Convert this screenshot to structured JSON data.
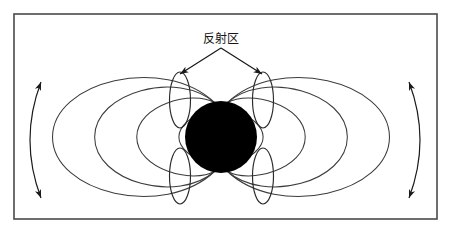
{
  "figure": {
    "title_label": "反射区",
    "frame": {
      "x": 14,
      "y": 14,
      "width": 423,
      "height": 205,
      "stroke": "#4a4a4a",
      "fill": "#ffffff"
    },
    "core": {
      "name": "central-body",
      "cx": 221,
      "cy": 137,
      "r": 36,
      "color": "#000000"
    },
    "label": {
      "text": "反射区",
      "x": 221,
      "y": 43,
      "color": "#151515",
      "font_size": 12
    },
    "pointers": [
      {
        "from_x": 221,
        "from_y": 48,
        "to_x": 180,
        "to_y": 74,
        "direction": "down-left"
      },
      {
        "from_x": 221,
        "from_y": 48,
        "to_x": 262,
        "to_y": 74,
        "direction": "down-right"
      }
    ],
    "reflection_zones": [
      {
        "id": "upper-left",
        "cx": 180,
        "cy": 100,
        "rx": 10.5,
        "ry": 28
      },
      {
        "id": "upper-right",
        "cx": 263,
        "cy": 100,
        "rx": 10.5,
        "ry": 28
      },
      {
        "id": "lower-left",
        "cx": 180,
        "cy": 176,
        "rx": 10.5,
        "ry": 28
      },
      {
        "id": "lower-right",
        "cx": 263,
        "cy": 176,
        "rx": 10.5,
        "ry": 28
      }
    ],
    "field_lines": {
      "count_per_side": 4,
      "half_widths": [
        26,
        52,
        78,
        104
      ],
      "half_heights": [
        21,
        39,
        55,
        68
      ],
      "stroke": "#3c3c3c"
    },
    "flow_arrows": [
      {
        "id": "left-flow-arrow",
        "side": "left",
        "top_x": 41,
        "top_y": 82,
        "bottom_x": 41,
        "bottom_y": 198,
        "bulge": -22,
        "heads": "both"
      },
      {
        "id": "right-flow-arrow",
        "side": "right",
        "top_x": 409,
        "top_y": 82,
        "bottom_x": 409,
        "bottom_y": 198,
        "bulge": 22,
        "heads": "both"
      }
    ],
    "colors": {
      "background": "#ffffff",
      "frame_stroke": "#4a4a4a",
      "field_stroke": "#3c3c3c",
      "core_fill": "#000000",
      "label_color": "#151515"
    }
  }
}
